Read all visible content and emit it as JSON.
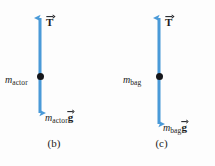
{
  "figure": {
    "background_color": "#fdfdfd",
    "arrow_color": "#4a9ad8",
    "dot_color": "#15161a",
    "text_color": "#1b1c20"
  },
  "panels": [
    {
      "id": "b",
      "caption": "(b)",
      "tension": {
        "symbol": "T",
        "is_vector": true,
        "direction": "up"
      },
      "mass": {
        "base": "m",
        "subscript": "actor"
      },
      "weight": {
        "base": "m",
        "subscript": "actor",
        "symbol": "g",
        "is_vector": true,
        "direction": "down"
      },
      "arrow": {
        "x": 40,
        "top_y": 18,
        "bottom_y": 113,
        "double_headed": true
      },
      "dot_y": 76
    },
    {
      "id": "c",
      "caption": "(c)",
      "tension": {
        "symbol": "T",
        "is_vector": true,
        "direction": "up"
      },
      "mass": {
        "base": "m",
        "subscript": "bag"
      },
      "weight": {
        "base": "m",
        "subscript": "bag",
        "symbol": "g",
        "is_vector": true,
        "direction": "down"
      },
      "arrow": {
        "x": 51,
        "top_y": 18,
        "bottom_y": 124,
        "double_headed": true
      },
      "dot_y": 76
    }
  ]
}
